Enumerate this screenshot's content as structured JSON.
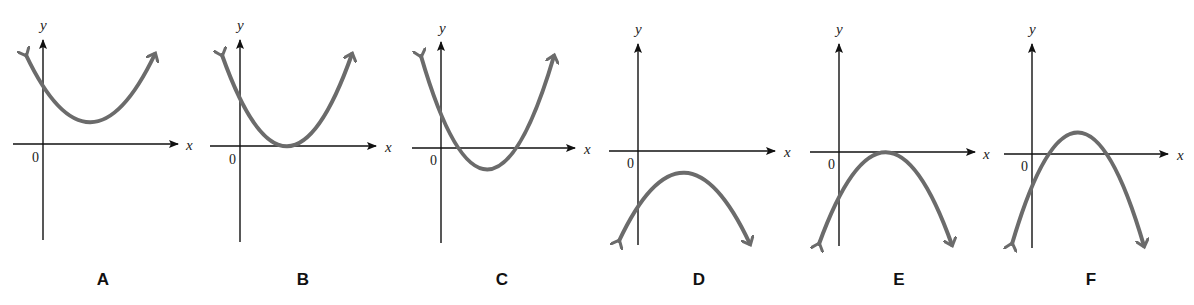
{
  "figure": {
    "axis_labels": {
      "x": "x",
      "y": "y",
      "origin": "0"
    },
    "curve_color": "#6b6b6b",
    "axis_color": "#111111"
  },
  "panels": [
    {
      "label": "A",
      "opens": "up",
      "vertex_position": "above x-axis",
      "x_intercepts": 0
    },
    {
      "label": "B",
      "opens": "up",
      "vertex_position": "on x-axis",
      "x_intercepts": 1
    },
    {
      "label": "C",
      "opens": "up",
      "vertex_position": "below x-axis",
      "x_intercepts": 2
    },
    {
      "label": "D",
      "opens": "down",
      "vertex_position": "below x-axis",
      "x_intercepts": 0
    },
    {
      "label": "E",
      "opens": "down",
      "vertex_position": "on x-axis",
      "x_intercepts": 1
    },
    {
      "label": "F",
      "opens": "down",
      "vertex_position": "above x-axis",
      "x_intercepts": 2
    }
  ]
}
